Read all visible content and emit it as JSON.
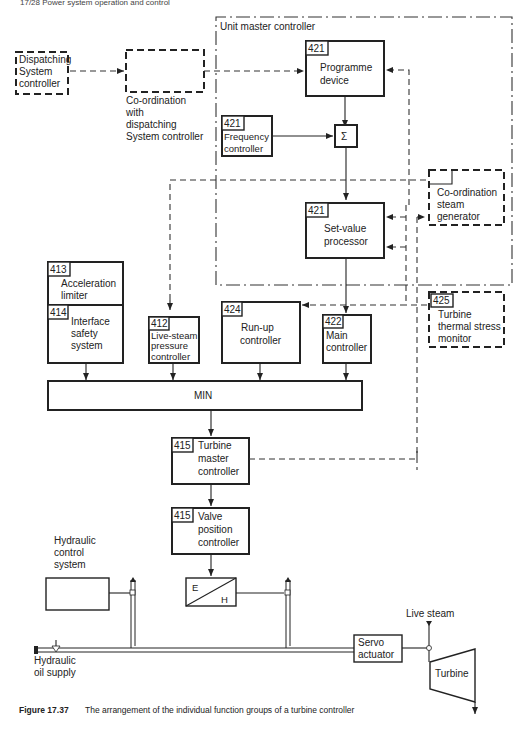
{
  "header": {
    "running_title": "17/28  Power system operation and control"
  },
  "boundary": {
    "label": "Unit master controller"
  },
  "blocks": {
    "dispatching": {
      "line1": "Dispatching",
      "line2": "System",
      "line3": "controller"
    },
    "coordination_dispatch": {
      "line1": "Co-ordination",
      "line2": "with",
      "line3": "dispatching",
      "line4": "System controller"
    },
    "programme": {
      "num": "421",
      "line1": "Programme",
      "line2": "device"
    },
    "frequency": {
      "num": "421",
      "line1": "Frequency",
      "line2": "controller"
    },
    "sum": {
      "symbol": "Σ"
    },
    "setvalue": {
      "num": "421",
      "line1": "Set-value",
      "line2": "processor"
    },
    "coord_steam": {
      "line1": "Co-ordination",
      "line2": "steam",
      "line3": "generator"
    },
    "acceleration": {
      "num": "413",
      "line1": "Acceleration",
      "line2": "limiter"
    },
    "interface": {
      "num": "414",
      "line1": "Interface",
      "line2": "safety",
      "line3": "system"
    },
    "livesteam": {
      "num": "412",
      "line1": "Live-steam",
      "line2": "pressure",
      "line3": "controller"
    },
    "runup": {
      "num": "424",
      "line1": "Run-up",
      "line2": "controller"
    },
    "main": {
      "num": "422",
      "line1": "Main",
      "line2": "controller"
    },
    "thermal": {
      "num": "425",
      "line1": "Turbine",
      "line2": "thermal stress",
      "line3": "monitor"
    },
    "min": {
      "label": "MIN"
    },
    "turbine_master": {
      "num": "415",
      "line1": "Turbine",
      "line2": "master",
      "line3": "controller"
    },
    "valve": {
      "num": "415",
      "line1": "Valve",
      "line2": "position",
      "line3": "controller"
    },
    "hydraulic_control": {
      "line1": "Hydraulic",
      "line2": "control",
      "line3": "system"
    },
    "eh": {
      "e": "E",
      "h": "H"
    },
    "servo": {
      "line1": "Servo",
      "line2": "actuator"
    },
    "turbine": {
      "label": "Turbine"
    },
    "live_steam": {
      "label": "Live steam"
    },
    "oil_supply": {
      "line1": "Hydraulic",
      "line2": "oil supply"
    }
  },
  "caption": {
    "label": "Figure 17.37",
    "text": "The arrangement of the individual function groups of a turbine controller"
  }
}
